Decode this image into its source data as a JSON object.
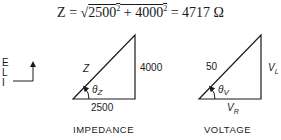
{
  "equation": {
    "lhs": "Z",
    "eq1": " = ",
    "sqrt_symbol": "√",
    "term1": "2500",
    "exp1": "2",
    "plus": " + ",
    "term2": "4000",
    "exp2": "2",
    "eq2": " = ",
    "result": "4717 Ω"
  },
  "axes": {
    "labels": [
      "E",
      "L",
      "I"
    ]
  },
  "impedance_triangle": {
    "hypotenuse": "Z",
    "vertical": "4000",
    "horizontal": "2500",
    "angle_symbol": "θ",
    "angle_sub": "Z",
    "caption": "IMPEDANCE"
  },
  "voltage_triangle": {
    "hypotenuse": "50",
    "vertical": "V",
    "vertical_sub": "L",
    "horizontal": "V",
    "horizontal_sub": "R",
    "angle_symbol": "θ",
    "angle_sub": "V",
    "caption": "VOLTAGE"
  },
  "colors": {
    "line": "#1a1a1a",
    "background": "#ffffff"
  }
}
